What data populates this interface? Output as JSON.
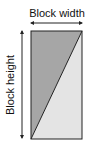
{
  "diagram": {
    "width_label": "Block width",
    "height_label": "Block height",
    "colors": {
      "dark_region": "#a6a6a6",
      "light_region": "#e4e4e4",
      "stroke": "#222222"
    }
  }
}
